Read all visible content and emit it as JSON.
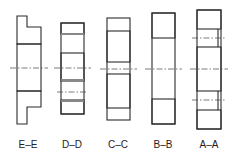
{
  "figure": {
    "sections": [
      {
        "id": "E",
        "label": "E–E"
      },
      {
        "id": "D",
        "label": "D–D"
      },
      {
        "id": "C",
        "label": "C–C"
      },
      {
        "id": "B",
        "label": "B–B"
      },
      {
        "id": "A",
        "label": "A–A"
      }
    ],
    "colors": {
      "line": "#2a2a2a",
      "background": "#ffffff"
    }
  }
}
